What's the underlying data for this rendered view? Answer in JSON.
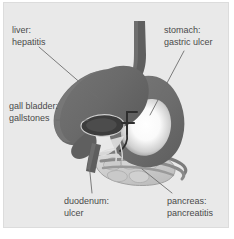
{
  "figure": {
    "background_color": "#e9e9e9",
    "border_color": "#dcdcdc",
    "leader_line_color": "#6e6e6e",
    "text_color": "#4a4a4a"
  },
  "labels": {
    "liver": {
      "term": "liver:",
      "condition": "hepatitis"
    },
    "gallbladder": {
      "term": "gall bladder:",
      "condition": "gallstones"
    },
    "stomach": {
      "term": "stomach:",
      "condition": "gastric ulcer"
    },
    "duodenum": {
      "term": "duodenum:",
      "condition": "ulcer"
    },
    "pancreas": {
      "term": "pancreas:",
      "condition": "pancreatitis"
    }
  },
  "organs": {
    "liver": {
      "name": "liver",
      "fill": "#6b6b6b"
    },
    "stomach": {
      "name": "stomach",
      "fill": "#6f6f6f",
      "cavity_fill": "#fbfbfb"
    },
    "esophagus": {
      "name": "esophagus",
      "fill": "#5f5f5f"
    },
    "gallbladder": {
      "name": "gallbladder",
      "fill": "#3f3f3f",
      "outline": "#c9c9c9"
    },
    "duodenum": {
      "name": "duodenum",
      "fill": "#5e5e5e"
    },
    "pancreas": {
      "name": "pancreas",
      "fill": "#d2d2d2",
      "outline": "#8d8d8d"
    },
    "ducts": {
      "name": "bile-ducts",
      "stroke": "#3a3a3a"
    }
  }
}
